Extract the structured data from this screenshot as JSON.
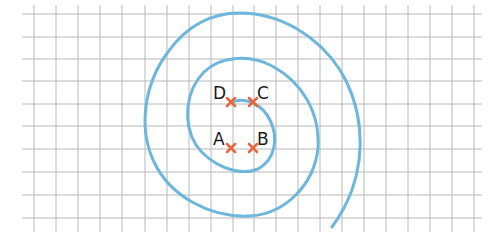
{
  "diagram": {
    "type": "spiral-on-grid",
    "grid": {
      "cell_size_px": 22.3,
      "line_color": "#b8b8b8",
      "x_lines": [
        34,
        56,
        78,
        100,
        122,
        145,
        167,
        189,
        211,
        233,
        254,
        276,
        298,
        320,
        342,
        364,
        386,
        408,
        430,
        452,
        474
      ],
      "y_lines": [
        14,
        37,
        59,
        81,
        104,
        126,
        149,
        172,
        195,
        218
      ],
      "x_extent": [
        22,
        482
      ],
      "y_extent": [
        5,
        232
      ]
    },
    "spiral": {
      "color": "#6db6dc",
      "stroke_width": 3
    },
    "points": [
      {
        "label": "A",
        "x": 231,
        "y": 148
      },
      {
        "label": "B",
        "x": 253,
        "y": 148
      },
      {
        "label": "C",
        "x": 253,
        "y": 102
      },
      {
        "label": "D",
        "x": 231,
        "y": 102
      }
    ],
    "marker_color": "#e8643c"
  }
}
